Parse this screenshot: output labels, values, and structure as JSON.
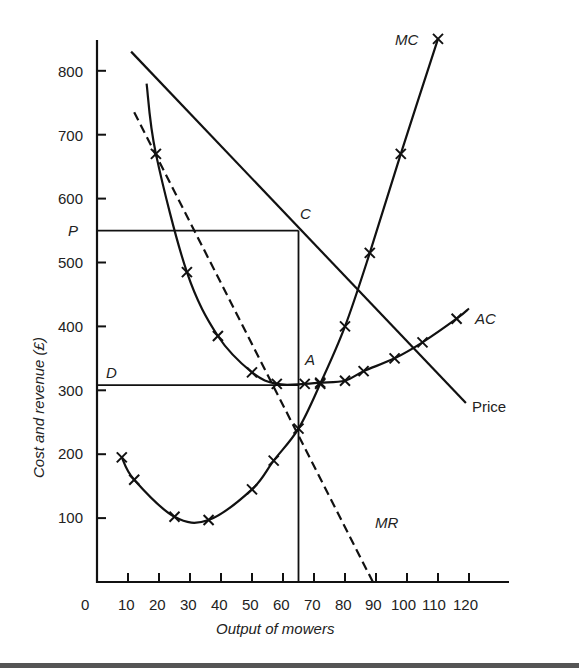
{
  "chart_data": {
    "type": "line",
    "title": "",
    "xlabel": "Output of mowers",
    "ylabel": "Cost and revenue (£)",
    "xlim": [
      0,
      120
    ],
    "ylim": [
      0,
      850
    ],
    "grid": false,
    "x_ticks": [
      0,
      10,
      20,
      30,
      40,
      50,
      60,
      70,
      80,
      90,
      100,
      110,
      120
    ],
    "y_ticks": [
      100,
      200,
      300,
      400,
      500,
      600,
      700,
      800
    ],
    "series": [
      {
        "name": "MC",
        "style": "solid-with-markers",
        "x": [
          8,
          12,
          25,
          36,
          50,
          57,
          65,
          72,
          80,
          88,
          98,
          110
        ],
        "values": [
          195,
          160,
          102,
          97,
          145,
          190,
          240,
          310,
          400,
          515,
          670,
          850
        ]
      },
      {
        "name": "AC",
        "style": "solid-with-markers",
        "x": [
          16,
          19,
          29,
          39,
          50,
          58,
          67,
          72,
          80,
          86,
          96,
          105,
          116,
          120
        ],
        "values": [
          780,
          670,
          485,
          385,
          328,
          310,
          310,
          312,
          315,
          330,
          350,
          375,
          412,
          428
        ],
        "markers_x": [
          19,
          29,
          39,
          50,
          58,
          67,
          72,
          80,
          86,
          96,
          105,
          116
        ]
      },
      {
        "name": "Price",
        "style": "solid",
        "x": [
          11,
          119
        ],
        "values": [
          830,
          280
        ]
      },
      {
        "name": "MR",
        "style": "dashed",
        "x": [
          12,
          89
        ],
        "values": [
          735,
          0
        ]
      }
    ],
    "annotations": [
      {
        "label": "P",
        "type": "price-level",
        "y": 550
      },
      {
        "label": "C",
        "type": "point",
        "x": 65,
        "y": 550
      },
      {
        "label": "D",
        "type": "cost-level",
        "y": 308
      },
      {
        "label": "A",
        "type": "point",
        "x": 67,
        "y": 308
      },
      {
        "label": "MC = MR",
        "type": "intersection",
        "x": 65,
        "y": 240
      }
    ],
    "guides": {
      "profit_max_output": 65,
      "price_P": 550,
      "average_cost_D": 308
    }
  },
  "labels": {
    "ylabel": "Cost and revenue (£)",
    "xlabel": "Output of mowers",
    "mc": "MC",
    "ac": "AC",
    "mr": "MR",
    "price": "Price",
    "p": "P",
    "c": "C",
    "d": "D",
    "a": "A",
    "x_tick_0": "0",
    "x_tick_10": "10",
    "x_tick_20": "20",
    "x_tick_30": "30",
    "x_tick_40": "40",
    "x_tick_50": "50",
    "x_tick_60": "60",
    "x_tick_70": "70",
    "x_tick_80": "80",
    "x_tick_90": "90",
    "x_tick_100": "100",
    "x_tick_110": "110",
    "x_tick_120": "120",
    "y_tick_100": "100",
    "y_tick_200": "200",
    "y_tick_300": "300",
    "y_tick_400": "400",
    "y_tick_500": "500",
    "y_tick_600": "600",
    "y_tick_700": "700",
    "y_tick_800": "800"
  }
}
